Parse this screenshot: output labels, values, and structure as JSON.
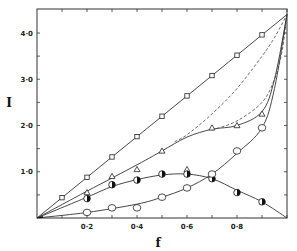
{
  "chart_data": {
    "type": "scatter",
    "title": "",
    "xlabel": "f",
    "ylabel": "I",
    "xlim": [
      0,
      1.0
    ],
    "ylim": [
      0,
      4.5
    ],
    "x_ticks": [
      0.2,
      0.4,
      0.6,
      0.8
    ],
    "x_tick_labels": [
      "0·2",
      "0·4",
      "0·6",
      "0·8"
    ],
    "y_ticks": [
      1.0,
      2.0,
      3.0,
      4.0
    ],
    "y_tick_labels": [
      "1·0",
      "2·0",
      "3·0",
      "4·0"
    ],
    "grid": false,
    "legend": "none",
    "series": [
      {
        "name": "open-squares",
        "marker": "square",
        "x": [
          0.1,
          0.2,
          0.3,
          0.4,
          0.5,
          0.6,
          0.7,
          0.8,
          0.9
        ],
        "y": [
          0.44,
          0.88,
          1.32,
          1.76,
          2.2,
          2.64,
          3.08,
          3.52,
          3.96
        ],
        "curve": {
          "style": "solid",
          "x": [
            0,
            1.0
          ],
          "y": [
            0,
            4.4
          ]
        }
      },
      {
        "name": "triangles",
        "marker": "triangle",
        "x": [
          0.2,
          0.3,
          0.4,
          0.5,
          0.6,
          0.7,
          0.8,
          0.9
        ],
        "y": [
          0.55,
          0.9,
          1.05,
          1.45,
          1.05,
          1.95,
          2.0,
          2.25
        ],
        "curve": {
          "style": "solid",
          "x": [
            0,
            0.2,
            0.4,
            0.5,
            0.6,
            0.7,
            0.8,
            0.9,
            0.95,
            1.0
          ],
          "y": [
            0,
            0.58,
            1.15,
            1.45,
            1.75,
            1.92,
            2.0,
            2.3,
            3.0,
            4.4
          ]
        }
      },
      {
        "name": "half-filled-circles",
        "marker": "half-circle",
        "x": [
          0.2,
          0.3,
          0.4,
          0.5,
          0.6,
          0.7,
          0.8,
          0.9
        ],
        "y": [
          0.42,
          0.72,
          0.82,
          0.95,
          0.95,
          0.85,
          0.55,
          0.35
        ],
        "curve": {
          "style": "solid",
          "x": [
            0,
            0.2,
            0.3,
            0.4,
            0.5,
            0.6,
            0.7,
            0.8,
            0.9,
            1.0
          ],
          "y": [
            0,
            0.45,
            0.68,
            0.83,
            0.93,
            0.95,
            0.85,
            0.6,
            0.35,
            0
          ]
        }
      },
      {
        "name": "open-circles",
        "marker": "circle",
        "x": [
          0.2,
          0.3,
          0.4,
          0.5,
          0.6,
          0.7,
          0.8,
          0.9
        ],
        "y": [
          0.12,
          0.22,
          0.22,
          0.45,
          0.65,
          0.95,
          1.45,
          1.95
        ],
        "curve": {
          "style": "solid",
          "x": [
            0,
            0.2,
            0.4,
            0.5,
            0.6,
            0.7,
            0.8,
            0.9,
            0.95,
            1.0
          ],
          "y": [
            0,
            0.12,
            0.3,
            0.45,
            0.65,
            0.95,
            1.4,
            1.95,
            2.8,
            4.4
          ]
        }
      }
    ],
    "dashed_curves": [
      {
        "name": "dashed-upper",
        "x": [
          0.55,
          0.6,
          0.7,
          0.8,
          0.9,
          0.95,
          1.0
        ],
        "y": [
          1.65,
          1.8,
          2.25,
          2.8,
          3.5,
          3.9,
          4.4
        ]
      },
      {
        "name": "dashed-lower",
        "x": [
          0.7,
          0.8,
          0.9,
          0.95,
          0.98,
          1.0
        ],
        "y": [
          1.9,
          2.1,
          2.5,
          3.0,
          3.6,
          4.4
        ]
      }
    ]
  }
}
